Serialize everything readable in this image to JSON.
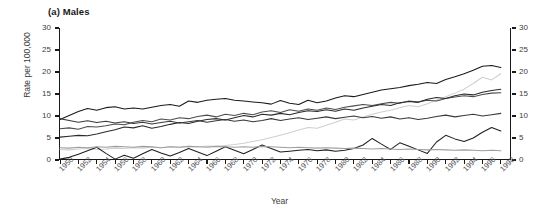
{
  "chart_data": {
    "type": "line",
    "title": "(a) Males",
    "xlabel": "Year",
    "ylabel": "Rate per 100,000",
    "ylabel_right": "",
    "ylim": [
      0,
      30
    ],
    "xlim": [
      1950,
      1999
    ],
    "grid": false,
    "legend": "none",
    "yticks": [
      0,
      5,
      10,
      15,
      20,
      25,
      30
    ],
    "yticks_right": [
      0,
      5,
      10,
      15,
      20,
      25,
      30
    ],
    "x": [
      1950,
      1951,
      1952,
      1953,
      1954,
      1955,
      1956,
      1957,
      1958,
      1959,
      1960,
      1961,
      1962,
      1963,
      1964,
      1965,
      1966,
      1967,
      1968,
      1969,
      1970,
      1971,
      1972,
      1973,
      1974,
      1975,
      1976,
      1977,
      1978,
      1979,
      1980,
      1981,
      1982,
      1983,
      1984,
      1985,
      1986,
      1987,
      1988,
      1989,
      1990,
      1991,
      1992,
      1993,
      1994,
      1995,
      1996,
      1997,
      1998
    ],
    "xtick_labels": [
      "1950",
      "1952",
      "1954",
      "1956",
      "1958",
      "1960",
      "1962",
      "1964",
      "1966",
      "1968",
      "1970",
      "1972",
      "1974",
      "1976",
      "1978",
      "1980",
      "1982",
      "1984",
      "1986",
      "1988",
      "1990",
      "1992",
      "1994",
      "1996",
      "1998"
    ],
    "xtick_values": [
      1950,
      1952,
      1954,
      1956,
      1958,
      1960,
      1962,
      1964,
      1966,
      1968,
      1970,
      1972,
      1974,
      1976,
      1978,
      1980,
      1982,
      1984,
      1986,
      1988,
      1990,
      1992,
      1994,
      1996,
      1998
    ],
    "series": [
      {
        "name": "series-1",
        "color": "#1a1a1a",
        "values": [
          9.2,
          10.1,
          11.0,
          11.7,
          11.3,
          11.9,
          12.1,
          11.6,
          11.8,
          11.6,
          12.0,
          12.4,
          12.6,
          12.2,
          13.4,
          13.1,
          13.6,
          13.8,
          14.0,
          13.6,
          13.4,
          13.2,
          13.0,
          12.7,
          13.5,
          12.9,
          12.6,
          13.6,
          13.0,
          13.4,
          14.1,
          14.6,
          14.4,
          14.9,
          15.4,
          15.9,
          16.2,
          16.5,
          16.9,
          17.2,
          17.6,
          17.4,
          18.3,
          18.9,
          19.6,
          20.4,
          21.3,
          21.5,
          21.0
        ]
      },
      {
        "name": "series-2",
        "color": "#cfcfcf",
        "values": [
          2.4,
          2.3,
          2.5,
          2.6,
          2.4,
          2.5,
          2.7,
          2.6,
          2.8,
          2.7,
          2.9,
          2.8,
          3.0,
          2.9,
          3.1,
          3.0,
          3.2,
          3.1,
          3.3,
          3.5,
          3.8,
          4.2,
          4.6,
          5.1,
          5.6,
          6.2,
          6.8,
          7.4,
          7.2,
          7.9,
          8.6,
          9.3,
          9.1,
          9.8,
          10.4,
          10.9,
          11.3,
          11.9,
          12.4,
          12.1,
          12.8,
          13.6,
          14.4,
          15.2,
          16.1,
          17.4,
          18.8,
          18.2,
          19.6
        ]
      },
      {
        "name": "series-3",
        "color": "#4d4d4d",
        "values": [
          7.1,
          7.3,
          7.0,
          7.6,
          7.5,
          7.8,
          8.2,
          8.0,
          8.6,
          9.0,
          8.7,
          9.3,
          9.1,
          9.6,
          9.4,
          9.9,
          10.2,
          9.8,
          10.4,
          10.1,
          10.6,
          10.3,
          10.9,
          11.2,
          10.8,
          11.4,
          11.1,
          11.6,
          11.3,
          11.8,
          11.5,
          12.0,
          12.3,
          12.6,
          12.4,
          12.8,
          13.1,
          12.9,
          13.4,
          13.2,
          13.6,
          13.4,
          14.0,
          14.3,
          14.6,
          14.4,
          14.9,
          15.2,
          15.3
        ]
      },
      {
        "name": "series-4",
        "color": "#2b2b2b",
        "values": [
          5.2,
          5.4,
          5.6,
          5.5,
          5.9,
          6.4,
          6.9,
          7.5,
          7.3,
          7.8,
          7.2,
          7.6,
          8.1,
          8.5,
          8.3,
          8.8,
          9.2,
          9.4,
          9.1,
          9.6,
          10.1,
          9.8,
          10.4,
          10.2,
          10.6,
          10.3,
          10.8,
          11.2,
          11.0,
          11.4,
          11.1,
          11.6,
          11.3,
          11.8,
          12.2,
          12.6,
          12.4,
          13.0,
          13.3,
          13.1,
          13.8,
          14.2,
          14.0,
          14.6,
          15.0,
          14.8,
          15.4,
          15.8,
          16.1
        ]
      },
      {
        "name": "series-5",
        "color": "#3a3a3a",
        "values": [
          9.4,
          9.0,
          8.6,
          8.9,
          8.5,
          8.8,
          8.4,
          8.7,
          8.3,
          8.6,
          8.2,
          8.5,
          8.8,
          8.4,
          8.7,
          9.0,
          8.6,
          8.9,
          9.2,
          8.8,
          9.1,
          8.7,
          9.0,
          9.4,
          9.0,
          9.3,
          9.6,
          9.2,
          9.5,
          9.8,
          9.4,
          9.7,
          10.0,
          9.6,
          9.9,
          9.5,
          9.8,
          9.3,
          9.6,
          9.2,
          9.5,
          9.9,
          10.2,
          9.8,
          10.1,
          10.4,
          10.0,
          10.3,
          10.6
        ]
      },
      {
        "name": "series-6",
        "color": "#1f1f1f",
        "values": [
          0.2,
          0.6,
          1.3,
          2.1,
          2.9,
          1.5,
          0.2,
          1.1,
          0.4,
          1.4,
          2.4,
          1.6,
          0.9,
          1.7,
          2.6,
          1.8,
          1.0,
          2.0,
          3.0,
          2.2,
          1.4,
          2.4,
          3.4,
          2.6,
          1.8,
          2.0,
          2.2,
          2.4,
          2.1,
          2.3,
          2.0,
          2.2,
          2.6,
          3.4,
          4.9,
          3.6,
          2.4,
          3.9,
          3.1,
          2.3,
          1.5,
          4.1,
          5.6,
          4.8,
          4.2,
          5.0,
          6.3,
          7.4,
          6.6
        ]
      },
      {
        "name": "series-7",
        "color": "#9e9e9e",
        "values": [
          2.8,
          2.7,
          2.9,
          2.8,
          3.0,
          2.9,
          3.1,
          3.0,
          2.9,
          3.1,
          3.0,
          2.8,
          3.0,
          2.9,
          3.1,
          3.0,
          2.9,
          3.1,
          3.0,
          2.9,
          3.0,
          2.9,
          3.1,
          3.0,
          2.9,
          2.8,
          2.9,
          2.8,
          2.7,
          2.8,
          2.7,
          2.6,
          2.7,
          2.6,
          2.5,
          2.6,
          2.5,
          2.4,
          2.5,
          2.4,
          2.3,
          2.4,
          2.3,
          2.2,
          2.3,
          2.2,
          2.1,
          2.2,
          2.1
        ]
      }
    ]
  }
}
